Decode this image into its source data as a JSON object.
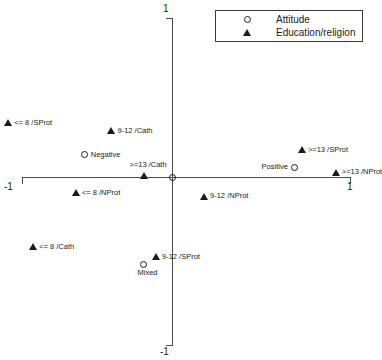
{
  "chart_data": {
    "type": "scatter",
    "title": "",
    "xlabel": "",
    "ylabel": "",
    "xlim": [
      -1,
      1
    ],
    "ylim": [
      -1,
      1
    ],
    "grid": false,
    "legend_position": "top-right",
    "xticks": [
      "-1",
      "1"
    ],
    "yticks": [
      "1",
      "-1"
    ],
    "legend": [
      {
        "label": "Attitude",
        "marker": "circle-marker"
      },
      {
        "label": "Education/religion",
        "marker": "triangle-marker"
      }
    ],
    "series": [
      {
        "name": "Attitude",
        "marker": "circle",
        "points": [
          {
            "label": "Negative",
            "x": -0.49,
            "y": 0.14,
            "label_pos": "right"
          },
          {
            "label": "Positive",
            "x": 0.69,
            "y": 0.06,
            "label_pos": "left"
          },
          {
            "label": "Mixed",
            "x": -0.16,
            "y": -0.55,
            "label_pos": "below"
          },
          {
            "label": "",
            "x": 0.0,
            "y": 0.0,
            "label_pos": "right"
          }
        ]
      },
      {
        "name": "Education/religion",
        "marker": "triangle",
        "points": [
          {
            "label": "<= 8 /SProt",
            "x": -0.92,
            "y": 0.34,
            "label_pos": "right"
          },
          {
            "label": "9-12 /Cath",
            "x": -0.34,
            "y": 0.29,
            "label_pos": "right"
          },
          {
            "label": ">=13 /SProt",
            "x": 0.73,
            "y": 0.17,
            "label_pos": "right"
          },
          {
            "label": ">=13 /NProt",
            "x": 0.92,
            "y": 0.03,
            "label_pos": "right"
          },
          {
            "label": ">=13 /Cath",
            "x": -0.16,
            "y": 0.01,
            "label_pos": "above"
          },
          {
            "label": "<= 8 /NProt",
            "x": -0.54,
            "y": -0.1,
            "label_pos": "right"
          },
          {
            "label": "9-12 /NProt",
            "x": 0.18,
            "y": -0.12,
            "label_pos": "right"
          },
          {
            "label": "<= 8 /Cath",
            "x": -0.78,
            "y": -0.44,
            "label_pos": "right"
          },
          {
            "label": "9-12 /SProt",
            "x": -0.09,
            "y": -0.5,
            "label_pos": "right"
          }
        ]
      }
    ]
  },
  "footer": {
    "clipped_caption": "                                                                                                    "
  }
}
